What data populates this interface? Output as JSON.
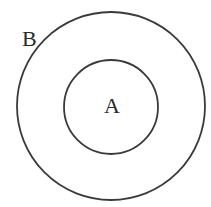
{
  "diagram": {
    "type": "concentric-circles",
    "stroke_color": "#3a3a3a",
    "background": "#ffffff",
    "outer_circle": {
      "label": "B",
      "cx": 111,
      "cy": 106,
      "r": 94
    },
    "inner_circle": {
      "label": "A",
      "cx": 111,
      "cy": 107,
      "r": 47
    }
  }
}
